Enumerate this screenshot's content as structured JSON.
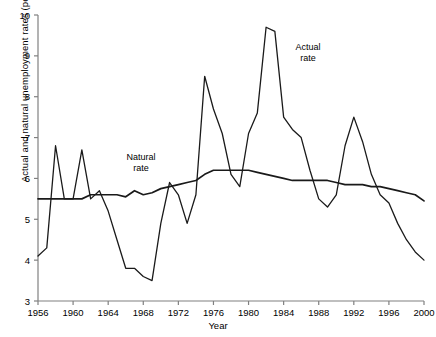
{
  "axes": {
    "x_title": "Year",
    "y_title": "Actual and natural unemployment rates (per cent)",
    "x_ticks": [
      "1956",
      "1960",
      "1964",
      "1968",
      "1972",
      "1976",
      "1980",
      "1984",
      "1988",
      "1992",
      "1996",
      "2000"
    ],
    "y_ticks": [
      "3",
      "4",
      "5",
      "6",
      "7",
      "8",
      "9",
      "10"
    ]
  },
  "annotations": {
    "natural_line1": "Natural",
    "natural_line2": "rate",
    "actual_line1": "Actual",
    "actual_line2": "rate"
  },
  "style": {
    "line_color": "#1a1a1a",
    "axis_color": "#808080",
    "background": "#ffffff"
  },
  "chart_data": {
    "type": "line",
    "title": "",
    "xlabel": "Year",
    "ylabel": "Actual and natural unemployment rates (per cent)",
    "xlim": [
      1956,
      2000
    ],
    "ylim": [
      3,
      10
    ],
    "grid": false,
    "legend": "inline-annotations",
    "x": [
      1956,
      1957,
      1958,
      1959,
      1960,
      1961,
      1962,
      1963,
      1964,
      1965,
      1966,
      1967,
      1968,
      1969,
      1970,
      1971,
      1972,
      1973,
      1974,
      1975,
      1976,
      1977,
      1978,
      1979,
      1980,
      1981,
      1982,
      1983,
      1984,
      1985,
      1986,
      1987,
      1988,
      1989,
      1990,
      1991,
      1992,
      1993,
      1994,
      1995,
      1996,
      1997,
      1998,
      1999,
      2000
    ],
    "series": [
      {
        "name": "Actual rate",
        "values": [
          4.1,
          4.3,
          6.8,
          5.5,
          5.5,
          6.7,
          5.5,
          5.7,
          5.2,
          4.5,
          3.8,
          3.8,
          3.6,
          3.5,
          4.9,
          5.9,
          5.6,
          4.9,
          5.6,
          8.5,
          7.7,
          7.1,
          6.1,
          5.8,
          7.1,
          7.6,
          9.7,
          9.6,
          7.5,
          7.2,
          7.0,
          6.2,
          5.5,
          5.3,
          5.6,
          6.8,
          7.5,
          6.9,
          6.1,
          5.6,
          5.4,
          4.9,
          4.5,
          4.2,
          4.0
        ]
      },
      {
        "name": "Natural rate",
        "values": [
          5.5,
          5.5,
          5.5,
          5.5,
          5.5,
          5.5,
          5.6,
          5.6,
          5.6,
          5.6,
          5.55,
          5.7,
          5.6,
          5.65,
          5.75,
          5.8,
          5.85,
          5.9,
          5.95,
          6.1,
          6.2,
          6.2,
          6.2,
          6.2,
          6.2,
          6.15,
          6.1,
          6.05,
          6.0,
          5.95,
          5.95,
          5.95,
          5.95,
          5.95,
          5.9,
          5.85,
          5.85,
          5.85,
          5.8,
          5.8,
          5.75,
          5.7,
          5.65,
          5.6,
          5.45
        ]
      }
    ]
  }
}
